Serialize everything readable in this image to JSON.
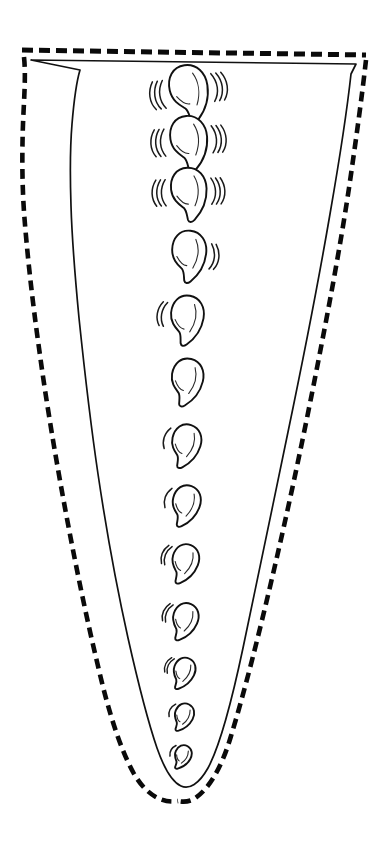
{
  "figure": {
    "background_color": "#ffffff",
    "ink_color": "#111111",
    "canvas": {
      "width": 390,
      "height": 843
    }
  },
  "drawing": {
    "rim": {
      "name": "dashed rim line",
      "left_x": 22,
      "right_x": 366,
      "left_y": 50,
      "right_y": 55,
      "stroke_width": 5.0,
      "dash_pattern": "11 6"
    },
    "inner_wall": {
      "name": "solid vessel wall outline",
      "stroke_width": 1.7,
      "top_left": [
        31,
        60
      ],
      "top_right": [
        357,
        64
      ],
      "bottom_tip": [
        181,
        786
      ],
      "path": "M 31 60 L 356 64 L 351 74 C 346 120 338 168 330 214 C 318 284 303 360 288 432 C 273 504 258 578 243 648 C 232 700 221 744 208 768 C 199 784 189 790 181 786 C 172 782 164 768 157 748 C 146 716 137 678 128 638 C 116 584 106 528 98 474 C 90 420 84 366 79 318 C 75 276 72 240 71 206 C 70 176 70 148 72 124 C 74 100 77 80 80 70 L 31 60 Z"
    },
    "reconstruction_contour": {
      "name": "dashed reconstruction outline",
      "stroke_width": 4.6,
      "dash_pattern": "10 6",
      "left_path": "M 24 57 C 26 76 24 98 23 124 C 22 152 22 182 24 212 C 27 252 32 298 39 348 C 46 400 55 454 65 508 C 75 562 86 616 98 666 C 108 710 120 748 133 772 C 145 794 162 804 178 801",
      "right_path": "M 366 60 C 362 96 356 140 349 188 C 340 248 328 312 315 378 C 302 444 288 510 273 574 C 259 634 245 690 231 736 C 221 770 207 792 192 800 C 187 802 182 802 178 801"
    },
    "motif_column": {
      "name": "vertical teardrop motif column",
      "count": 13,
      "center_x": 185,
      "description": "column of teardrop/comma motifs decreasing in size downward",
      "items": [
        {
          "index": 1,
          "cx": 188,
          "cy": 91,
          "size": 30,
          "rotation": -8,
          "accents": 3,
          "accent_side": "both"
        },
        {
          "index": 2,
          "cx": 188,
          "cy": 141,
          "size": 29,
          "rotation": -4,
          "accents": 3,
          "accent_side": "both"
        },
        {
          "index": 3,
          "cx": 188,
          "cy": 192,
          "size": 28,
          "rotation": -2,
          "accents": 3,
          "accent_side": "both"
        },
        {
          "index": 4,
          "cx": 188,
          "cy": 254,
          "size": 27,
          "rotation": 6,
          "accents": 2,
          "accent_side": "right"
        },
        {
          "index": 5,
          "cx": 186,
          "cy": 318,
          "size": 26,
          "rotation": 10,
          "accents": 2,
          "accent_side": "left"
        },
        {
          "index": 6,
          "cx": 186,
          "cy": 380,
          "size": 25,
          "rotation": 14,
          "accents": 0,
          "accent_side": "none"
        },
        {
          "index": 7,
          "cx": 185,
          "cy": 444,
          "size": 23,
          "rotation": 18,
          "accents": 1,
          "accent_side": "left"
        },
        {
          "index": 8,
          "cx": 185,
          "cy": 504,
          "size": 22,
          "rotation": 20,
          "accents": 1,
          "accent_side": "left"
        },
        {
          "index": 9,
          "cx": 184,
          "cy": 562,
          "size": 21,
          "rotation": 22,
          "accents": 2,
          "accent_side": "left"
        },
        {
          "index": 10,
          "cx": 184,
          "cy": 620,
          "size": 20,
          "rotation": 24,
          "accents": 2,
          "accent_side": "left"
        },
        {
          "index": 11,
          "cx": 183,
          "cy": 672,
          "size": 17,
          "rotation": 26,
          "accents": 2,
          "accent_side": "left"
        },
        {
          "index": 12,
          "cx": 183,
          "cy": 716,
          "size": 15,
          "rotation": 28,
          "accents": 1,
          "accent_side": "left"
        },
        {
          "index": 13,
          "cx": 182,
          "cy": 756,
          "size": 13,
          "rotation": 30,
          "accents": 1,
          "accent_side": "left"
        }
      ]
    }
  }
}
